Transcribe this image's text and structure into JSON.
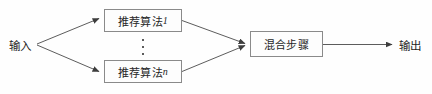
{
  "diagram": {
    "colors": {
      "background": "#fefefe",
      "box_border": "#8a8a8a",
      "box_fill": "#fdfdfd",
      "line": "#4a4a4a",
      "text": "#262626"
    },
    "input": {
      "label": "输入"
    },
    "output": {
      "label": "输出"
    },
    "algorithm_nodes": [
      {
        "name": "推荐算法1",
        "text": "推荐算法",
        "index": "1"
      },
      {
        "name": "推荐算法n",
        "text": "推荐算法",
        "index": "n"
      }
    ],
    "ellipsis": {
      "glyph": "⋮",
      "meaning": "more-algorithms"
    },
    "blend_node": {
      "label": "混合步骤"
    },
    "edges": [
      {
        "from": "输入",
        "to": "推荐算法1",
        "arrow": true
      },
      {
        "from": "输入",
        "to": "推荐算法n",
        "arrow": true
      },
      {
        "from": "推荐算法1",
        "to": "混合步骤",
        "arrow": true
      },
      {
        "from": "推荐算法n",
        "to": "混合步骤",
        "arrow": true
      },
      {
        "from": "混合步骤",
        "to": "输出",
        "arrow": true
      }
    ]
  }
}
